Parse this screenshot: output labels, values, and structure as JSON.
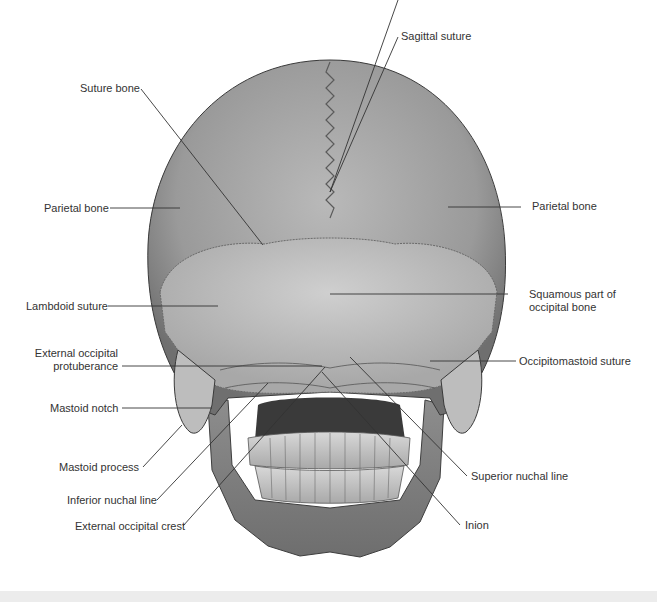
{
  "figure": {
    "background": "#ffffff",
    "bone_color": "#9c9c9c",
    "line_color": "#333333"
  },
  "labels": {
    "sagittal_suture": "Sagittal suture",
    "suture_bone": "Suture bone",
    "parietal_bone_left": "Parietal bone",
    "parietal_bone_right": "Parietal bone",
    "lambdoid_suture": "Lambdoid suture",
    "squamous_part_line1": "Squamous part of",
    "squamous_part_line2": "occipital bone",
    "ext_occ_protuberance_line1": "External occipital",
    "ext_occ_protuberance_line2": "protuberance",
    "occipitomastoid_suture": "Occipitomastoid suture",
    "mastoid_notch": "Mastoid notch",
    "mastoid_process": "Mastoid process",
    "inferior_nuchal_line": "Inferior nuchal line",
    "external_occipital_crest": "External occipital crest",
    "superior_nuchal_line": "Superior nuchal line",
    "inion": "Inion"
  }
}
